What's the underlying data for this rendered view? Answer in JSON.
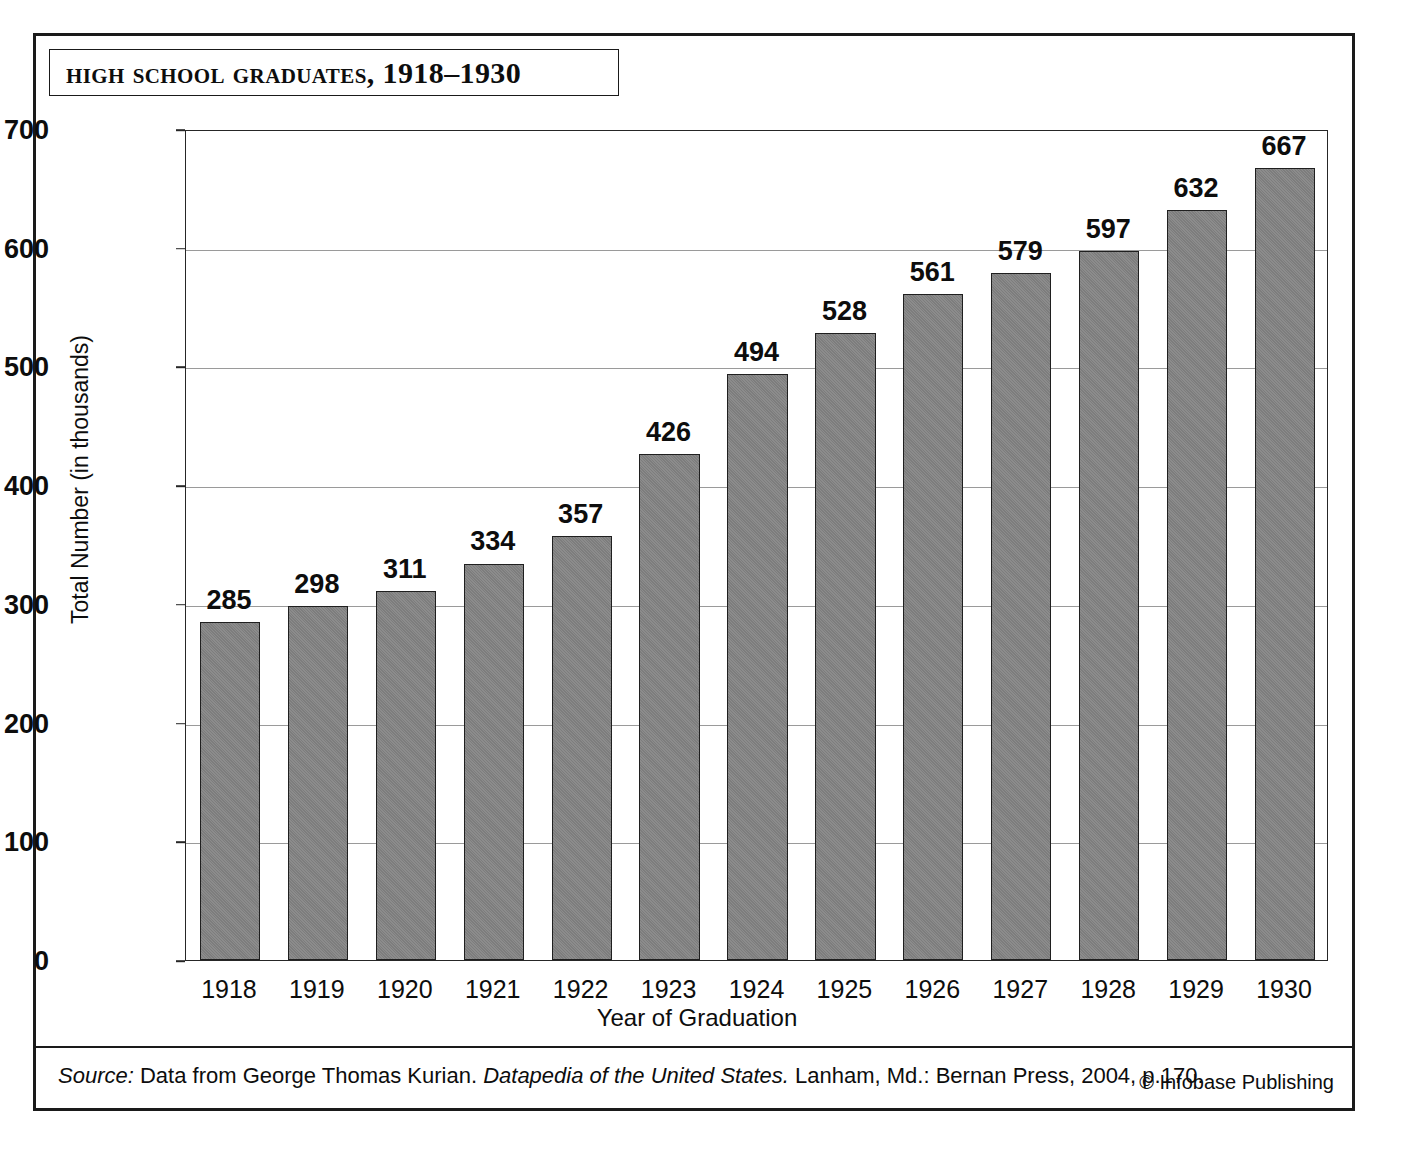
{
  "figure": {
    "title": "High School Graduates, 1918–1930",
    "x_axis_title": "Year of Graduation",
    "y_axis_title": "Total Number (in thousands)",
    "source_prefix": "Source:",
    "source_text_1": " Data from George Thomas Kurian. ",
    "source_book": "Datapedia of the United States.",
    "source_text_2": " Lanham, Md.: Bernan Press, 2004, p.170.",
    "copyright": "© Infobase Publishing",
    "bar_color": "#878787",
    "bar_edge_color": "#1f1f1f",
    "frame_color": "#1a1a1a",
    "gridline_color": "#9a9a9a"
  },
  "chart_data": {
    "type": "bar",
    "title": "High School Graduates, 1918–1930",
    "xlabel": "Year of Graduation",
    "ylabel": "Total Number (in thousands)",
    "ylim": [
      0,
      700
    ],
    "ytick_step": 100,
    "yticks": [
      0,
      100,
      200,
      300,
      400,
      500,
      600,
      700
    ],
    "grid": true,
    "legend": null,
    "categories": [
      "1918",
      "1919",
      "1920",
      "1921",
      "1922",
      "1923",
      "1924",
      "1925",
      "1926",
      "1927",
      "1928",
      "1929",
      "1930"
    ],
    "values": [
      285,
      298,
      311,
      334,
      357,
      426,
      494,
      528,
      561,
      579,
      597,
      632,
      667
    ],
    "data_labels": [
      "285",
      "298",
      "311",
      "334",
      "357",
      "426",
      "494",
      "528",
      "561",
      "579",
      "597",
      "632",
      "667"
    ]
  }
}
